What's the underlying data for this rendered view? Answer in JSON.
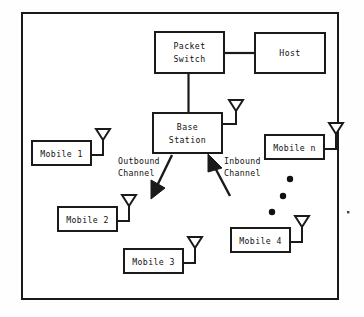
{
  "diagram": {
    "frame": {
      "x": 22,
      "y": 13,
      "width": 316,
      "height": 286,
      "stroke": "#1a1a1a"
    },
    "colors": {
      "line": "#1a1a1a",
      "text": "#111111",
      "background": "#fefefe",
      "fill": "#ffffff"
    },
    "nodes": [
      {
        "id": "packet-switch",
        "label": "Packet\nSwitch",
        "line1": "Packet",
        "line2": "Switch",
        "x": 155,
        "y": 32,
        "width": 69,
        "height": 41,
        "antenna": false
      },
      {
        "id": "host",
        "label": "Host",
        "line1": "Host",
        "line2": "",
        "x": 255,
        "y": 33,
        "width": 70,
        "height": 40,
        "antenna": false
      },
      {
        "id": "base-station",
        "label": "Base\nStation",
        "line1": "Base",
        "line2": "Station",
        "x": 153,
        "y": 113,
        "width": 69,
        "height": 40,
        "antenna": true
      },
      {
        "id": "mobile-1",
        "label": "Mobile 1",
        "line1": "Mobile 1",
        "line2": "",
        "x": 32,
        "y": 141,
        "width": 59,
        "height": 24,
        "antenna": true
      },
      {
        "id": "mobile-n",
        "label": "Mobile n",
        "line1": "Mobile n",
        "line2": "",
        "x": 265,
        "y": 135,
        "width": 59,
        "height": 24,
        "antenna": true
      },
      {
        "id": "mobile-2",
        "label": "Mobile 2",
        "line1": "Mobile 2",
        "line2": "",
        "x": 58,
        "y": 207,
        "width": 59,
        "height": 24,
        "antenna": true
      },
      {
        "id": "mobile-3",
        "label": "Mobile 3",
        "line1": "Mobile 3",
        "line2": "",
        "x": 124,
        "y": 249,
        "width": 59,
        "height": 24,
        "antenna": true
      },
      {
        "id": "mobile-4",
        "label": "Mobile 4",
        "line1": "Mobile 4",
        "line2": "",
        "x": 231,
        "y": 228,
        "width": 59,
        "height": 24,
        "antenna": true
      }
    ],
    "links": [
      {
        "id": "switch-to-host",
        "from": "packet-switch",
        "to": "host",
        "orientation": "horizontal"
      },
      {
        "id": "switch-to-base",
        "from": "packet-switch",
        "to": "base-station",
        "orientation": "vertical"
      }
    ],
    "channels": [
      {
        "id": "outbound-channel",
        "line1": "Outbound",
        "line2": "Channel",
        "direction": "base-station-to-mobile",
        "label_x": 118,
        "label_y": 161
      },
      {
        "id": "inbound-channel",
        "line1": "Inbound",
        "line2": "Channel",
        "direction": "mobile-to-base-station",
        "label_x": 224,
        "label_y": 161
      }
    ],
    "ellipsis": {
      "id": "mobile-ellipsis",
      "meaning": "additional mobiles between Mobile 4 and Mobile n",
      "dots": [
        {
          "cx": 290,
          "cy": 179
        },
        {
          "cx": 283,
          "cy": 196
        },
        {
          "cx": 272,
          "cy": 212
        }
      ],
      "radius": 3.2
    },
    "artifacts": [
      {
        "id": "scan-speck",
        "cx": 348,
        "cy": 212,
        "size": 2.4
      }
    ]
  }
}
